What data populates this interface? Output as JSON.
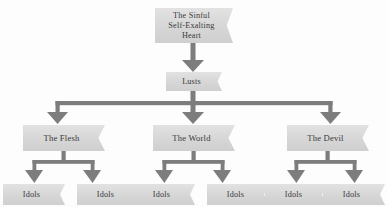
{
  "diagram": {
    "type": "flowchart-tree",
    "orientation": "top-down",
    "colors": {
      "node_fill": "#d8d8d8",
      "node_fill_light": "#e2e2e2",
      "connector": "#808080",
      "text": "#3a3a3a",
      "background": "#fdfdfd"
    },
    "node_shape": "banner-ribbon-right-notch",
    "levels": [
      {
        "level": 1,
        "nodes": [
          {
            "id": "root",
            "label": "The Sinful\nSelf-Exalting\nHeart"
          }
        ]
      },
      {
        "level": 2,
        "nodes": [
          {
            "id": "lusts",
            "label": "Lusts"
          }
        ]
      },
      {
        "level": 3,
        "nodes": [
          {
            "id": "flesh",
            "label": "The Flesh"
          },
          {
            "id": "world",
            "label": "The World"
          },
          {
            "id": "devil",
            "label": "The Devil"
          }
        ]
      },
      {
        "level": 4,
        "nodes": [
          {
            "id": "idol1",
            "label": "Idols",
            "parent": "flesh"
          },
          {
            "id": "idol2",
            "label": "Idols",
            "parent": "flesh"
          },
          {
            "id": "idol3",
            "label": "Idols",
            "parent": "world"
          },
          {
            "id": "idol4",
            "label": "Idols",
            "parent": "world"
          },
          {
            "id": "idol5",
            "label": "Idols",
            "parent": "devil"
          },
          {
            "id": "idol6",
            "label": "Idols",
            "parent": "devil"
          }
        ]
      }
    ],
    "edges": [
      {
        "from": "root",
        "to": "lusts",
        "style": "arrow-down"
      },
      {
        "from": "lusts",
        "to": "flesh",
        "style": "arrow-down-branch"
      },
      {
        "from": "lusts",
        "to": "world",
        "style": "arrow-down-branch"
      },
      {
        "from": "lusts",
        "to": "devil",
        "style": "arrow-down-branch"
      },
      {
        "from": "flesh",
        "to": "idol1",
        "style": "arrow-down-branch"
      },
      {
        "from": "flesh",
        "to": "idol2",
        "style": "arrow-down-branch"
      },
      {
        "from": "world",
        "to": "idol3",
        "style": "arrow-down-branch"
      },
      {
        "from": "world",
        "to": "idol4",
        "style": "arrow-down-branch"
      },
      {
        "from": "devil",
        "to": "idol5",
        "style": "arrow-down-branch"
      },
      {
        "from": "devil",
        "to": "idol6",
        "style": "arrow-down-branch"
      }
    ]
  }
}
